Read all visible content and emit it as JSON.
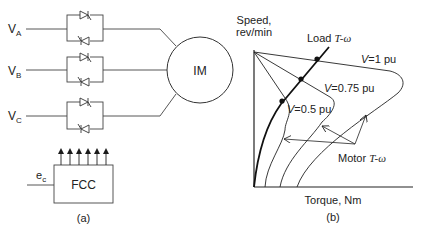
{
  "panel_a": {
    "caption": "(a)",
    "phases": [
      {
        "main": "V",
        "sub": "A"
      },
      {
        "main": "V",
        "sub": "B"
      },
      {
        "main": "V",
        "sub": "C"
      }
    ],
    "motor_label": "IM",
    "controller_label": "FCC",
    "control_input": {
      "main": "e",
      "sub": "c"
    },
    "gate_signal_count": 6
  },
  "panel_b": {
    "caption": "(b)",
    "y_axis_label_line1": "Speed,",
    "y_axis_label_line2": "rev/min",
    "x_axis_label": "Torque, Nm",
    "load_curve_label_prefix": "Load ",
    "load_curve_label_italic": "T-ω",
    "motor_curve_label_prefix": "Motor ",
    "motor_curve_label_italic": "T-ω",
    "voltage_labels": [
      {
        "var": "V",
        "value": "=1 pu"
      },
      {
        "var": "V",
        "value": "=0.75 pu"
      },
      {
        "var": "V",
        "value": "=0.5 pu"
      }
    ]
  },
  "colors": {
    "line": "#1a1a1a",
    "background": "#ffffff"
  }
}
